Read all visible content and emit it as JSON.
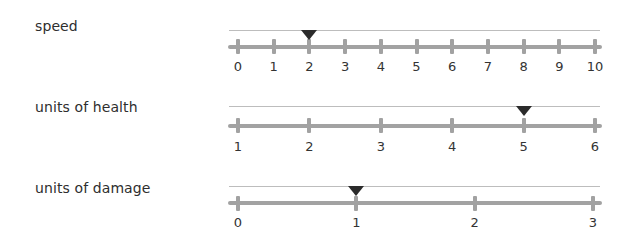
{
  "sliders": [
    {
      "label": "speed",
      "ticks": [
        "0",
        "1",
        "2",
        "3",
        "4",
        "5",
        "6",
        "7",
        "8",
        "9",
        "10"
      ],
      "value": 2,
      "min": 0,
      "max": 10
    },
    {
      "label": "units of health",
      "ticks": [
        "1",
        "2",
        "3",
        "4",
        "5",
        "6"
      ],
      "value": 5,
      "min": 1,
      "max": 6
    },
    {
      "label": "units of damage",
      "ticks": [
        "0",
        "1",
        "2",
        "3"
      ],
      "value": 1,
      "min": 0,
      "max": 3
    }
  ],
  "colors": {
    "axis": "#a2a2a2",
    "top_line": "#bdbdbd",
    "marker": "#2b2b2b",
    "text": "#2e2e2e"
  }
}
